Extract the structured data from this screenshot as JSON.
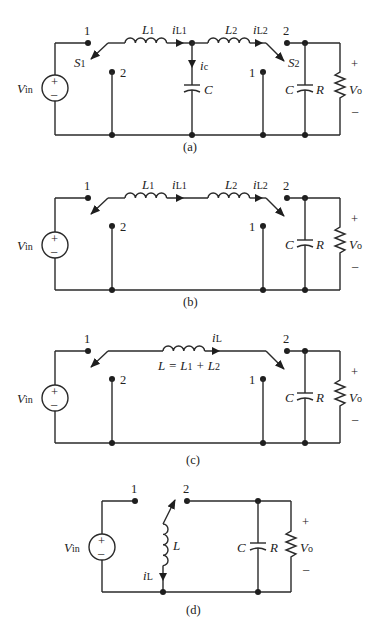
{
  "figure": {
    "panels": [
      {
        "id": "a",
        "caption": "(a)",
        "labels": {
          "source": "V",
          "source_sub": "in",
          "L1": "L",
          "L1_sub": "1",
          "iL1": "i",
          "iL1_sub": "L1",
          "L2": "L",
          "L2_sub": "2",
          "iL2": "i",
          "iL2_sub": "L2",
          "S1": "S",
          "S1_sub": "1",
          "S2": "S",
          "S2_sub": "2",
          "ic": "i",
          "ic_sub": "c",
          "C_mid": "C",
          "C_out": "C",
          "R": "R",
          "Vo": "V",
          "Vo_sub": "o",
          "plus": "+",
          "minus": "–",
          "node_1_left": "1",
          "node_2_left": "2",
          "node_1_right": "1",
          "node_2_right": "2"
        }
      },
      {
        "id": "b",
        "caption": "(b)",
        "labels": {
          "source": "V",
          "source_sub": "in",
          "L1": "L",
          "L1_sub": "1",
          "iL1": "i",
          "iL1_sub": "L1",
          "L2": "L",
          "L2_sub": "2",
          "iL2": "i",
          "iL2_sub": "L2",
          "C_out": "C",
          "R": "R",
          "Vo": "V",
          "Vo_sub": "o",
          "plus": "+",
          "minus": "–",
          "node_1_left": "1",
          "node_2_left": "2",
          "node_1_right": "1",
          "node_2_right": "2"
        }
      },
      {
        "id": "c",
        "caption": "(c)",
        "labels": {
          "source": "V",
          "source_sub": "in",
          "iL": "i",
          "iL_sub": "L",
          "L_eq": "L = L",
          "L_eq_sub1": "1",
          "L_eq_plus": " + L",
          "L_eq_sub2": "2",
          "C_out": "C",
          "R": "R",
          "Vo": "V",
          "Vo_sub": "o",
          "plus": "+",
          "minus": "–",
          "node_1_left": "1",
          "node_2_left": "2",
          "node_1_right": "1",
          "node_2_right": "2"
        }
      },
      {
        "id": "d",
        "caption": "(d)",
        "labels": {
          "source": "V",
          "source_sub": "in",
          "L": "L",
          "iL": "i",
          "iL_sub": "L",
          "C_out": "C",
          "R": "R",
          "Vo": "V",
          "Vo_sub": "o",
          "plus": "+",
          "minus": "–",
          "node_1": "1",
          "node_2": "2"
        }
      }
    ],
    "source_symbol": {
      "plus": "+",
      "minus": "–"
    }
  }
}
